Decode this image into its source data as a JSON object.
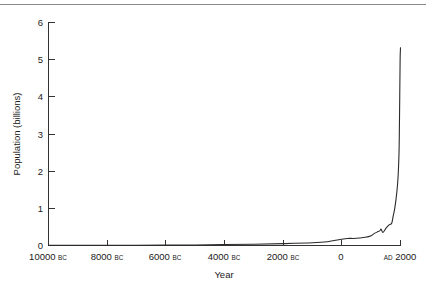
{
  "figure": {
    "background": "#ffffff",
    "line_color": "#2b2b2b",
    "axis_color": "#333333",
    "rule_color": "#8a8a8a"
  },
  "axes": {
    "x_title": "Year",
    "y_title": "Population (billions)",
    "y_ticks": [
      "0",
      "1",
      "2",
      "3",
      "4",
      "5",
      "6"
    ],
    "x_ticks": [
      {
        "num": "10000",
        "era": "BC"
      },
      {
        "num": "8000",
        "era": "BC"
      },
      {
        "num": "6000",
        "era": "BC"
      },
      {
        "num": "4000",
        "era": "BC"
      },
      {
        "num": "2000",
        "era": "BC"
      },
      {
        "num": "0",
        "era": ""
      },
      {
        "num": "2000",
        "era": "AD",
        "era_first": true
      }
    ]
  },
  "chart_data": {
    "type": "line",
    "title": "",
    "xlabel": "Year",
    "ylabel": "Population (billions)",
    "xlim": [
      -10000,
      2000
    ],
    "ylim": [
      0,
      6
    ],
    "grid": false,
    "legend": "none",
    "x_tick_values": [
      -10000,
      -8000,
      -6000,
      -4000,
      -2000,
      0,
      2000
    ],
    "x_tick_labels": [
      "10000 BC",
      "8000 BC",
      "6000 BC",
      "4000 BC",
      "2000 BC",
      "0",
      "AD 2000"
    ],
    "y_tick_values": [
      0,
      1,
      2,
      3,
      4,
      5,
      6
    ],
    "annotations": [
      "Near-flat population below 0.1 billion from 10000 BC through roughly 2000 BC",
      "Slow rise through antiquity, small dip near AD 1350 (plague)",
      "Near-vertical exponential rise after AD 1800"
    ],
    "series": [
      {
        "name": "World population",
        "x": [
          -10000,
          -9000,
          -8000,
          -7000,
          -6000,
          -5000,
          -4000,
          -3000,
          -2000,
          -1000,
          -500,
          0,
          200,
          400,
          600,
          800,
          1000,
          1100,
          1200,
          1300,
          1340,
          1400,
          1500,
          1600,
          1700,
          1750,
          1800,
          1850,
          1900,
          1927,
          1950,
          1960,
          1974,
          1987,
          1999,
          2000
        ],
        "y": [
          0.004,
          0.005,
          0.005,
          0.007,
          0.01,
          0.015,
          0.025,
          0.035,
          0.05,
          0.072,
          0.1,
          0.17,
          0.19,
          0.19,
          0.2,
          0.22,
          0.265,
          0.32,
          0.36,
          0.4,
          0.44,
          0.35,
          0.46,
          0.55,
          0.6,
          0.79,
          0.98,
          1.26,
          1.65,
          2.0,
          2.5,
          3.0,
          4.0,
          5.0,
          5.3,
          5.3
        ]
      }
    ]
  }
}
